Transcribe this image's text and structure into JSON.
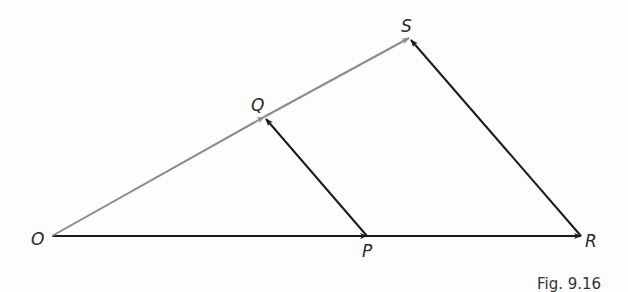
{
  "figure": {
    "caption": "Fig. 9.16",
    "colors": {
      "background": "#fdfdfd",
      "black_vector": "#1a1a1a",
      "gray_vector": "#8c8c8c",
      "label": "#2a2a2a"
    },
    "points": {
      "O": {
        "label": "O",
        "x": 52,
        "y": 236
      },
      "P": {
        "label": "P",
        "x": 367,
        "y": 236
      },
      "R": {
        "label": "R",
        "x": 581,
        "y": 236
      },
      "Q": {
        "label": "Q",
        "x": 264,
        "y": 117
      },
      "S": {
        "label": "S",
        "x": 409,
        "y": 38
      }
    },
    "vectors": [
      {
        "from": "O",
        "to": "P",
        "color": "black"
      },
      {
        "from": "P",
        "to": "R",
        "color": "black"
      },
      {
        "from": "O",
        "to": "Q",
        "color": "gray"
      },
      {
        "from": "Q",
        "to": "S",
        "color": "gray"
      },
      {
        "from": "P",
        "to": "Q",
        "color": "black"
      },
      {
        "from": "R",
        "to": "S",
        "color": "black"
      }
    ]
  }
}
